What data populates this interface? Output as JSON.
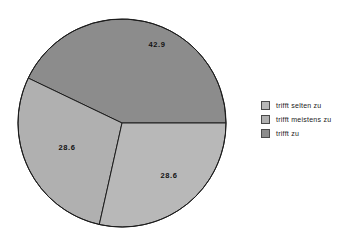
{
  "chart_data": {
    "type": "pie",
    "title": "",
    "subtitle": "",
    "xlabel": "",
    "ylabel": "",
    "grid": false,
    "legend_position": "right",
    "units": "percent",
    "start_angle_deg": 0,
    "direction": "counterclockwise",
    "categories": [
      "trifft selten zu",
      "trifft meistens zu",
      "trifft zu"
    ],
    "values": [
      28.6,
      28.6,
      42.9
    ],
    "colors": [
      "#b8b8b8",
      "#b0b0b0",
      "#8c8c8c"
    ],
    "slices": [
      {
        "label": "trifft zu",
        "value": 42.9,
        "value_text": "42.9",
        "color": "#8c8c8c",
        "start_angle_deg": 0,
        "end_angle_deg": 154.4,
        "label_x": 140,
        "label_y": 27
      },
      {
        "label": "trifft meistens zu",
        "value": 28.6,
        "value_text": "28.6",
        "color": "#b0b0b0",
        "start_angle_deg": 154.4,
        "end_angle_deg": 257.4,
        "label_x": 50,
        "label_y": 130
      },
      {
        "label": "trifft selten zu",
        "value": 28.6,
        "value_text": "28.6",
        "color": "#b8b8b8",
        "start_angle_deg": 257.4,
        "end_angle_deg": 360,
        "label_x": 152,
        "label_y": 158
      }
    ],
    "geometry": {
      "center_x": 105,
      "center_y": 105,
      "radius": 104
    }
  },
  "legend": {
    "items": [
      {
        "label": "trifft selten zu",
        "color": "#b8b8b8"
      },
      {
        "label": "trifft meistens zu",
        "color": "#b0b0b0"
      },
      {
        "label": "trifft zu",
        "color": "#8c8c8c"
      }
    ]
  }
}
